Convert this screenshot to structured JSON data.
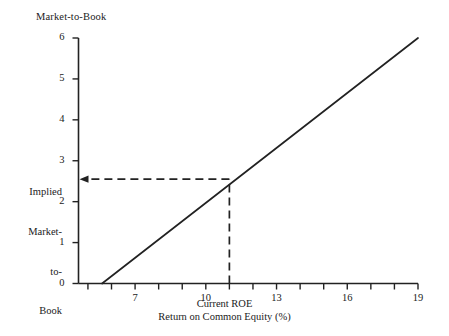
{
  "chart_data": {
    "type": "line",
    "title": "",
    "xlabel": "Current ROE\nReturn on Common Equity (%)",
    "xlabel_line1": "Current ROE",
    "xlabel_line2": "Return on Common Equity (%)",
    "ylabel": "Market-to-Book",
    "xlim": [
      4.6,
      19
    ],
    "ylim": [
      0,
      6
    ],
    "grid": false,
    "legend": null,
    "x_tick_values": [
      5,
      6,
      7,
      8,
      9,
      10,
      11,
      12,
      13,
      14,
      15,
      16,
      17,
      18,
      19
    ],
    "x_tick_labels": [
      "",
      "",
      "7",
      "",
      "",
      "10",
      "",
      "",
      "13",
      "",
      "",
      "16",
      "",
      "",
      "19"
    ],
    "y_tick_values": [
      0,
      1,
      2,
      3,
      4,
      5,
      6
    ],
    "y_tick_labels": [
      "0",
      "1",
      "2",
      "3",
      "4",
      "5",
      "6"
    ],
    "series": [
      {
        "name": "Implied Market-to-Book vs Current ROE",
        "style": "solid",
        "x": [
          5.6,
          19
        ],
        "y": [
          0,
          6
        ]
      }
    ],
    "annotations": [
      {
        "name": "implied-value-guide",
        "style": "dashed",
        "arrow": "left",
        "label": "Implied\nMarket-\nto-\nBook",
        "label_lines": [
          "Implied",
          "Market-",
          "to-",
          "Book"
        ],
        "x_value": 11.0,
        "y_value": 2.55
      }
    ]
  },
  "axes": {
    "y_title": "Market-to-Book",
    "x_title_line1": "Current ROE",
    "x_title_line2": "Return on Common Equity (%)"
  },
  "implied_label": {
    "line1": "Implied",
    "line2": "Market-",
    "line3": "to-",
    "line4": "Book"
  },
  "colors": {
    "background": "#ffffff",
    "ink": "#1a1a1a",
    "line": "#222222"
  }
}
